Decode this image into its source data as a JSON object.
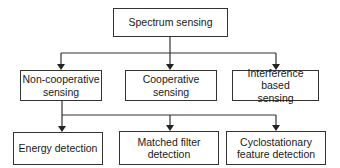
{
  "diagram": {
    "type": "hierarchy",
    "root": {
      "label": "Spectrum sensing"
    },
    "level1": [
      {
        "label": "Non-cooperative sensing"
      },
      {
        "label": "Cooperative sensing"
      },
      {
        "label": "Interference based sensing"
      }
    ],
    "level2_parent": "Non-cooperative sensing",
    "level2": [
      {
        "label": "Energy detection"
      },
      {
        "label": "Matched filter detection"
      },
      {
        "label": "Cyclostationary feature detection"
      }
    ],
    "colors": {
      "line": "#333333",
      "box_border": "#333333",
      "background": "#ffffff"
    }
  }
}
